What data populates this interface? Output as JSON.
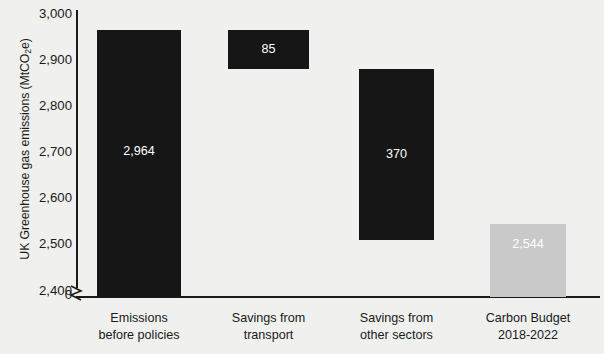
{
  "chart_data": {
    "type": "bar",
    "chart_style": "waterfall",
    "title": "",
    "xlabel": "",
    "ylabel": "UK Greenhouse gas emissions (MtCO2e)",
    "ylabel_parts": {
      "before": "UK Greenhouse gas emissions (MtCO",
      "sub": "2",
      "after": "e)"
    },
    "ylim": [
      2400,
      3000
    ],
    "y_axis_break": true,
    "y_axis_break_label": "0",
    "grid": false,
    "legend": null,
    "categories": [
      "Emissions before policies",
      "Savings from transport",
      "Savings from other sectors",
      "Carbon Budget 2018-2022"
    ],
    "category_lines": [
      [
        "Emissions",
        "before policies"
      ],
      [
        "Savings from",
        "transport"
      ],
      [
        "Savings from",
        "other sectors"
      ],
      [
        "Carbon Budget",
        "2018-2022"
      ]
    ],
    "values": [
      2964,
      85,
      370,
      2544
    ],
    "value_labels": [
      "2,964",
      "85",
      "370",
      "2,544"
    ],
    "bar_spans": [
      {
        "bottom": 2400,
        "top": 2964,
        "floating": false
      },
      {
        "bottom": 2879,
        "top": 2964,
        "floating": true
      },
      {
        "bottom": 2509,
        "top": 2879,
        "floating": true
      },
      {
        "bottom": 2400,
        "top": 2544,
        "floating": false
      }
    ],
    "bar_colors": [
      "#161616",
      "#161616",
      "#161616",
      "#c9c9c9"
    ],
    "value_label_colors": [
      "#ffffff",
      "#ffffff",
      "#ffffff",
      "#ffffff"
    ],
    "y_ticks": [
      2400,
      2500,
      2600,
      2700,
      2800,
      2900,
      3000
    ],
    "y_tick_labels": [
      "2,400",
      "2,500",
      "2,600",
      "2,700",
      "2,800",
      "2,900",
      "3,000"
    ],
    "background_color": "#f0f0ee",
    "axis_color": "#1a1a1a"
  },
  "axis": {
    "break_zero_label": "0"
  }
}
